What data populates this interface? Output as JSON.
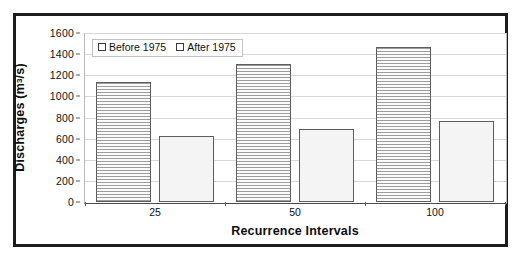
{
  "chart_data": {
    "type": "bar",
    "title": "",
    "categories": [
      "25",
      "50",
      "100"
    ],
    "series": [
      {
        "name": "Before 1975",
        "values": [
          1140,
          1305,
          1470
        ]
      },
      {
        "name": "After 1975",
        "values": [
          625,
          690,
          765
        ]
      }
    ],
    "xlabel": "Recurrence Intervals",
    "ylabel": "Discharges (m3/s)",
    "ylabel_parts": {
      "text": "Discharges (m",
      "sup": "3",
      "tail": "/s)"
    },
    "ylim": [
      0,
      1600
    ],
    "ytick_step": 200,
    "yticks": [
      "1600",
      "1400",
      "1200",
      "1000",
      "800",
      "600",
      "400",
      "200",
      "0"
    ],
    "grid": true,
    "legend_position": "top-left",
    "legend": [
      "Before 1975",
      "After 1975"
    ]
  },
  "style": {
    "frame_color": "#1c1c1c",
    "plot_border_color": "#b8b8b8",
    "axis_color": "#4a4a4a",
    "grid_color": "#d8d8d8",
    "bar_border_color": "#5d5d5d",
    "bar_before_fill": "#f2f2f2",
    "bar_after_fill": "#f4f4f4",
    "text_color": "#111111",
    "background": "#ffffff"
  }
}
